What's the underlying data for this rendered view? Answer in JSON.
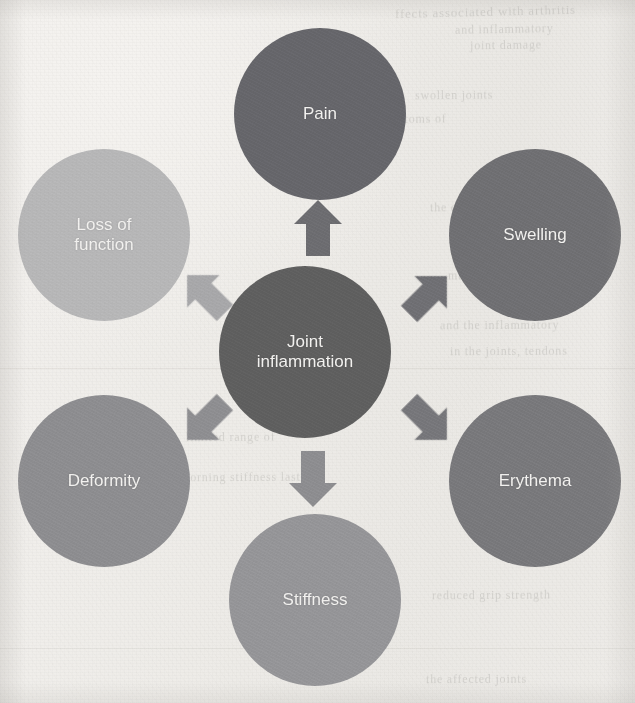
{
  "page": {
    "type": "radial-concept-diagram",
    "background_color": "#efedea",
    "width": 635,
    "height": 703
  },
  "diagram": {
    "center": {
      "id": "joint-inflammation",
      "label": "Joint inflammation",
      "label_lines": [
        "Joint",
        "inflammation"
      ],
      "color": "#5e5e5e",
      "cx": 305,
      "cy": 352,
      "r": 86,
      "font_size": 17
    },
    "nodes": [
      {
        "id": "pain",
        "label": "Pain",
        "label_lines": [
          "Pain"
        ],
        "color": "#65656a",
        "cx": 320,
        "cy": 114,
        "r": 86,
        "font_size": 17,
        "direction": "up"
      },
      {
        "id": "swelling",
        "label": "Swelling",
        "label_lines": [
          "Swelling"
        ],
        "color": "#6f6f72",
        "cx": 535,
        "cy": 235,
        "r": 86,
        "font_size": 17,
        "direction": "up-right"
      },
      {
        "id": "erythema",
        "label": "Erythema",
        "label_lines": [
          "Erythema"
        ],
        "color": "#78787b",
        "cx": 535,
        "cy": 481,
        "r": 86,
        "font_size": 17,
        "direction": "down-right"
      },
      {
        "id": "stiffness",
        "label": "Stiffness",
        "label_lines": [
          "Stiffness"
        ],
        "color": "#959598",
        "cx": 315,
        "cy": 600,
        "r": 86,
        "font_size": 17,
        "direction": "down"
      },
      {
        "id": "deformity",
        "label": "Deformity",
        "label_lines": [
          "Deformity"
        ],
        "color": "#8d8d90",
        "cx": 104,
        "cy": 481,
        "r": 86,
        "font_size": 17,
        "direction": "down-left"
      },
      {
        "id": "loss-of-function",
        "label": "Loss of function",
        "label_lines": [
          "Loss of",
          "function"
        ],
        "color": "#b7b7b8",
        "cx": 104,
        "cy": 235,
        "r": 86,
        "font_size": 17,
        "direction": "up-left"
      }
    ],
    "arrows": [
      {
        "id": "arrow-to-pain",
        "from": "joint-inflammation",
        "to": "pain",
        "color": "#6c6c70",
        "angle": 0,
        "cx": 318,
        "cy": 228,
        "w": 48,
        "h": 56
      },
      {
        "id": "arrow-to-swelling",
        "from": "joint-inflammation",
        "to": "swelling",
        "color": "#6f6f73",
        "angle": 45,
        "cx": 428,
        "cy": 295,
        "w": 45,
        "h": 53
      },
      {
        "id": "arrow-to-erythema",
        "from": "joint-inflammation",
        "to": "erythema",
        "color": "#76767a",
        "angle": 135,
        "cx": 428,
        "cy": 420,
        "w": 45,
        "h": 53
      },
      {
        "id": "arrow-to-stiffness",
        "from": "joint-inflammation",
        "to": "stiffness",
        "color": "#8d8d90",
        "angle": 180,
        "cx": 313,
        "cy": 479,
        "w": 48,
        "h": 56
      },
      {
        "id": "arrow-to-deformity",
        "from": "joint-inflammation",
        "to": "deformity",
        "color": "#8e8e91",
        "angle": 225,
        "cx": 206,
        "cy": 420,
        "w": 45,
        "h": 53
      },
      {
        "id": "arrow-to-loss-of-function",
        "from": "joint-inflammation",
        "to": "loss-of-function",
        "color": "#a8a8aa",
        "angle": 315,
        "cx": 206,
        "cy": 293,
        "w": 45,
        "h": 53
      }
    ]
  },
  "background_bleedthrough": [
    {
      "text": "ffects associated with arthritis",
      "x": 395,
      "y": 4,
      "size": 13,
      "rotate": -1.4
    },
    {
      "text": "and inflammatory",
      "x": 455,
      "y": 22,
      "size": 12,
      "rotate": -1.0
    },
    {
      "text": "joint damage",
      "x": 470,
      "y": 38,
      "size": 12,
      "rotate": -0.8
    },
    {
      "text": "swollen joints",
      "x": 415,
      "y": 88,
      "size": 12,
      "rotate": -0.6
    },
    {
      "text": "section Symptoms of",
      "x": 330,
      "y": 112,
      "size": 12,
      "rotate": -0.5
    },
    {
      "text": "the course of the disease",
      "x": 430,
      "y": 200,
      "size": 12,
      "rotate": -0.4
    },
    {
      "text": "may also present with",
      "x": 448,
      "y": 268,
      "size": 12,
      "rotate": -0.5
    },
    {
      "text": "and the inflammatory",
      "x": 440,
      "y": 318,
      "size": 12,
      "rotate": -0.4
    },
    {
      "text": "in the joints, tendons",
      "x": 450,
      "y": 344,
      "size": 12,
      "rotate": -0.3
    },
    {
      "text": "limited range of",
      "x": 186,
      "y": 430,
      "size": 12,
      "rotate": -0.4
    },
    {
      "text": "morning stiffness lasting",
      "x": 180,
      "y": 470,
      "size": 12,
      "rotate": -0.3
    },
    {
      "text": "reduced grip strength",
      "x": 432,
      "y": 588,
      "size": 12,
      "rotate": -0.4
    },
    {
      "text": "the affected joints",
      "x": 426,
      "y": 672,
      "size": 12,
      "rotate": -0.3
    }
  ]
}
